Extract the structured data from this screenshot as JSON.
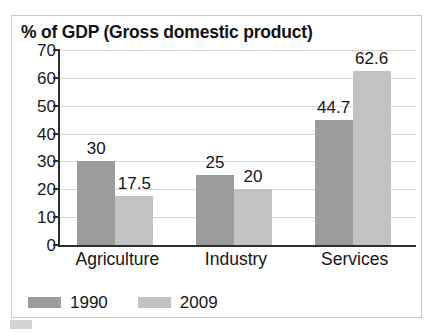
{
  "chart_data": {
    "type": "bar",
    "title": "% of GDP (Gross domestic product)",
    "xlabel": "",
    "ylabel": "",
    "ylim": [
      0,
      70
    ],
    "ytick_step": 10,
    "yticks": [
      70,
      60,
      50,
      40,
      30,
      20,
      10,
      0
    ],
    "grid": true,
    "legend_position": "bottom-left",
    "categories": [
      "Agriculture",
      "Industry",
      "Services"
    ],
    "series": [
      {
        "name": "1990",
        "color": "#9c9c9c",
        "values": [
          30,
          25,
          44.7
        ],
        "labels": [
          "30",
          "25",
          "44.7"
        ]
      },
      {
        "name": "2009",
        "color": "#c2c2c2",
        "values": [
          17.5,
          20,
          62.6
        ],
        "labels": [
          "17.5",
          "20",
          "62.6"
        ]
      }
    ]
  },
  "colors": {
    "series_1990": "#9c9c9c",
    "series_2009": "#c2c2c2",
    "axis": "#2e2e2e",
    "gridline": "#d8d8d8",
    "card_border": "#c8c8c8",
    "text": "#151515"
  }
}
